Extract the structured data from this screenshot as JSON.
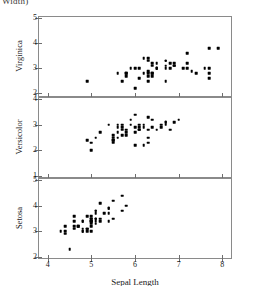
{
  "figure": {
    "top_caption_fragment": "Width)",
    "width_px": 254,
    "height_px": 286
  },
  "chart_data": {
    "type": "scatter",
    "title": "",
    "xlabel": "Sepal Length",
    "ylabel": "",
    "xlim": [
      3.8,
      8.2
    ],
    "xticks": [
      4,
      5,
      6,
      7,
      8
    ],
    "xticklabels": [
      "4",
      "5",
      "6",
      "7",
      "8"
    ],
    "grid": false,
    "legend": "none",
    "marker": "filled-square",
    "marker_color": "#000000",
    "panels": [
      {
        "label": "Virginica",
        "ylim": [
          1.9,
          5.05
        ],
        "yticks": [
          2,
          3,
          4,
          5
        ],
        "yticklabels": [
          "2",
          "3",
          "4",
          "5"
        ],
        "points": [
          [
            4.9,
            2.5
          ],
          [
            5.6,
            2.8
          ],
          [
            5.7,
            2.5
          ],
          [
            5.8,
            2.7
          ],
          [
            5.8,
            2.8
          ],
          [
            5.8,
            2.8
          ],
          [
            5.9,
            3.0
          ],
          [
            6.0,
            2.2
          ],
          [
            6.0,
            3.0
          ],
          [
            6.1,
            2.6
          ],
          [
            6.1,
            3.0
          ],
          [
            6.2,
            2.8
          ],
          [
            6.2,
            3.4
          ],
          [
            6.3,
            2.5
          ],
          [
            6.3,
            2.7
          ],
          [
            6.3,
            2.8
          ],
          [
            6.3,
            2.9
          ],
          [
            6.3,
            3.3
          ],
          [
            6.3,
            3.4
          ],
          [
            6.4,
            2.7
          ],
          [
            6.4,
            2.8
          ],
          [
            6.4,
            2.8
          ],
          [
            6.4,
            3.1
          ],
          [
            6.4,
            3.2
          ],
          [
            6.5,
            3.0
          ],
          [
            6.5,
            3.0
          ],
          [
            6.5,
            3.0
          ],
          [
            6.5,
            3.2
          ],
          [
            6.7,
            2.5
          ],
          [
            6.7,
            3.0
          ],
          [
            6.7,
            3.1
          ],
          [
            6.7,
            3.3
          ],
          [
            6.8,
            3.0
          ],
          [
            6.8,
            3.2
          ],
          [
            6.9,
            3.1
          ],
          [
            6.9,
            3.1
          ],
          [
            6.9,
            3.2
          ],
          [
            7.1,
            3.0
          ],
          [
            7.2,
            3.0
          ],
          [
            7.2,
            3.2
          ],
          [
            7.2,
            3.6
          ],
          [
            7.3,
            2.9
          ],
          [
            7.4,
            2.8
          ],
          [
            7.6,
            3.0
          ],
          [
            7.7,
            2.6
          ],
          [
            7.7,
            2.8
          ],
          [
            7.7,
            3.0
          ],
          [
            7.7,
            3.8
          ],
          [
            7.9,
            3.8
          ],
          [
            6.7,
            3.3
          ]
        ]
      },
      {
        "label": "Versicolor",
        "ylim": [
          0.95,
          4.05
        ],
        "yticks": [
          1,
          2,
          3,
          4
        ],
        "yticklabels": [
          "1",
          "2",
          "3",
          "4"
        ],
        "points": [
          [
            4.9,
            2.4
          ],
          [
            5.0,
            2.0
          ],
          [
            5.0,
            2.3
          ],
          [
            5.1,
            2.5
          ],
          [
            5.2,
            2.7
          ],
          [
            5.4,
            3.0
          ],
          [
            5.5,
            2.3
          ],
          [
            5.5,
            2.4
          ],
          [
            5.5,
            2.4
          ],
          [
            5.5,
            2.5
          ],
          [
            5.5,
            2.6
          ],
          [
            5.6,
            2.5
          ],
          [
            5.6,
            2.7
          ],
          [
            5.6,
            2.9
          ],
          [
            5.6,
            3.0
          ],
          [
            5.7,
            2.6
          ],
          [
            5.7,
            2.8
          ],
          [
            5.7,
            2.9
          ],
          [
            5.7,
            3.0
          ],
          [
            5.8,
            2.6
          ],
          [
            5.8,
            2.7
          ],
          [
            5.9,
            3.0
          ],
          [
            5.9,
            3.2
          ],
          [
            6.0,
            2.2
          ],
          [
            6.0,
            2.7
          ],
          [
            6.0,
            2.9
          ],
          [
            6.0,
            3.4
          ],
          [
            6.1,
            2.8
          ],
          [
            6.1,
            2.8
          ],
          [
            6.1,
            2.9
          ],
          [
            6.1,
            3.0
          ],
          [
            6.2,
            2.2
          ],
          [
            6.2,
            2.9
          ],
          [
            6.3,
            2.3
          ],
          [
            6.3,
            2.5
          ],
          [
            6.3,
            3.3
          ],
          [
            6.4,
            2.9
          ],
          [
            6.4,
            3.2
          ],
          [
            6.5,
            2.8
          ],
          [
            6.6,
            2.9
          ],
          [
            6.6,
            3.0
          ],
          [
            6.7,
            3.0
          ],
          [
            6.7,
            3.1
          ],
          [
            6.7,
            3.1
          ],
          [
            6.8,
            2.8
          ],
          [
            6.9,
            3.1
          ],
          [
            7.0,
            3.2
          ],
          [
            5.8,
            2.8
          ],
          [
            6.3,
            2.8
          ],
          [
            6.2,
            3.0
          ]
        ]
      },
      {
        "label": "Setosa",
        "ylim": [
          1.95,
          5.05
        ],
        "yticks": [
          2,
          3,
          4,
          5
        ],
        "yticklabels": [
          "2",
          "3",
          "4",
          "5"
        ],
        "points": [
          [
            4.3,
            3.0
          ],
          [
            4.4,
            2.9
          ],
          [
            4.4,
            3.0
          ],
          [
            4.4,
            3.2
          ],
          [
            4.5,
            2.3
          ],
          [
            4.6,
            3.1
          ],
          [
            4.6,
            3.2
          ],
          [
            4.6,
            3.4
          ],
          [
            4.6,
            3.6
          ],
          [
            4.7,
            3.2
          ],
          [
            4.7,
            3.2
          ],
          [
            4.8,
            3.0
          ],
          [
            4.8,
            3.0
          ],
          [
            4.8,
            3.1
          ],
          [
            4.8,
            3.4
          ],
          [
            4.8,
            3.4
          ],
          [
            4.9,
            3.0
          ],
          [
            4.9,
            3.1
          ],
          [
            4.9,
            3.1
          ],
          [
            4.9,
            3.6
          ],
          [
            5.0,
            3.0
          ],
          [
            5.0,
            3.2
          ],
          [
            5.0,
            3.3
          ],
          [
            5.0,
            3.4
          ],
          [
            5.0,
            3.4
          ],
          [
            5.0,
            3.5
          ],
          [
            5.0,
            3.5
          ],
          [
            5.0,
            3.6
          ],
          [
            5.1,
            3.3
          ],
          [
            5.1,
            3.4
          ],
          [
            5.1,
            3.5
          ],
          [
            5.1,
            3.5
          ],
          [
            5.1,
            3.7
          ],
          [
            5.1,
            3.8
          ],
          [
            5.1,
            3.8
          ],
          [
            5.2,
            3.4
          ],
          [
            5.2,
            3.5
          ],
          [
            5.2,
            4.1
          ],
          [
            5.3,
            3.7
          ],
          [
            5.4,
            3.4
          ],
          [
            5.4,
            3.7
          ],
          [
            5.4,
            3.9
          ],
          [
            5.4,
            3.9
          ],
          [
            5.5,
            3.5
          ],
          [
            5.5,
            4.2
          ],
          [
            5.7,
            3.8
          ],
          [
            5.7,
            4.4
          ],
          [
            5.8,
            4.0
          ],
          [
            5.1,
            3.5
          ],
          [
            5.0,
            3.4
          ]
        ]
      }
    ]
  }
}
